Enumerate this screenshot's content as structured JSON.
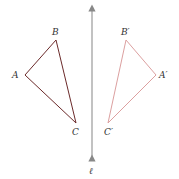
{
  "diagram": {
    "line_label": "ℓ",
    "original": {
      "A": "A",
      "B": "B",
      "C": "C",
      "color": "#7a2a2a"
    },
    "image": {
      "A": "A′",
      "B": "B′",
      "C": "C′",
      "color": "#d99a9a"
    },
    "axis_color": "#888888"
  }
}
